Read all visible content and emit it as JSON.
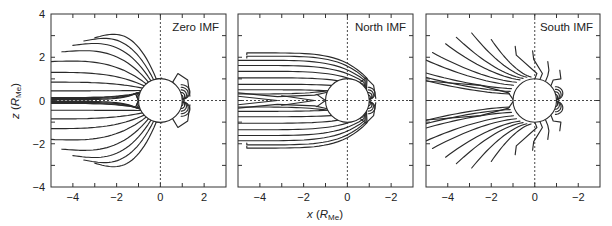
{
  "figure": {
    "y_axis_label_main": "z",
    "y_axis_label_unit": "R",
    "y_axis_label_sub": "Me",
    "x_axis_label_main": "x",
    "x_axis_label_unit": "R",
    "x_axis_label_sub": "Me",
    "colors": {
      "line": "#2a2a2a",
      "frame": "#333333",
      "background": "#ffffff"
    }
  },
  "chart_data": [
    {
      "type": "line",
      "title": "Zero IMF",
      "xlabel": "x (R_Me)",
      "ylabel": "z (R_Me)",
      "xlim": [
        -5,
        3
      ],
      "ylim": [
        -4,
        4
      ],
      "xticks": [
        -4,
        -2,
        0,
        2
      ],
      "xtick_labels": [
        "-4",
        "-2",
        "0",
        "2"
      ],
      "yticks": [
        -4,
        -2,
        0,
        2,
        4
      ],
      "ytick_labels": [
        "-4",
        "-2",
        "0",
        "2",
        "4"
      ],
      "grid": false,
      "reference_lines": {
        "x": 0,
        "z": 0,
        "style": "dotted"
      },
      "planet": {
        "center": [
          0,
          0
        ],
        "radius": 1
      },
      "description": "Closed magnetospheric field lines; tail lines stretched nearly parallel to x-axis, dayside lines compressed near x≈1.2-1.4",
      "tail_line_endpoints_z": [
        0.15,
        0.55,
        0.95,
        1.35,
        1.8,
        2.1,
        2.4,
        2.65,
        2.85,
        -0.15,
        -0.55,
        -0.95,
        -1.35,
        -1.8,
        -2.1,
        -2.4,
        -2.65,
        -2.85
      ],
      "tail_line_endpoints_x": [
        -5,
        -5,
        -5,
        -5,
        -5,
        -4.5,
        -4,
        -3.5,
        -3.1,
        -5,
        -5,
        -5,
        -5,
        -5,
        -4.5,
        -4,
        -3.5,
        -3.1
      ]
    },
    {
      "type": "line",
      "title": "North IMF",
      "xlabel": "x (R_Me)",
      "ylabel": "z (R_Me)",
      "xlim": [
        -5,
        3
      ],
      "ylim": [
        -4,
        4
      ],
      "xticks": [
        -4,
        -2,
        0,
        2
      ],
      "xtick_labels": [
        "-4",
        "-2",
        "0",
        "-2"
      ],
      "yticks": [
        -4,
        -2,
        0,
        2,
        4
      ],
      "ytick_labels": [
        "",
        "",
        "",
        "",
        ""
      ],
      "grid": false,
      "reference_lines": {
        "x": 0,
        "z": 0,
        "style": "dotted"
      },
      "planet": {
        "center": [
          0,
          0
        ],
        "radius": 1
      },
      "description": "Closed field lines forming a blunt, box-like magnetosphere; tail lines turn back near x≈-4.5; inner tail lines close at x≈-3.2 and x≈-1.5",
      "tail_line_endpoints_z": [
        0.7,
        1.0,
        1.3,
        1.6,
        1.9,
        2.1,
        2.2,
        -0.7,
        -1.0,
        -1.3,
        -1.6,
        -1.9,
        -2.1,
        -2.2
      ],
      "tail_line_endpoints_x": [
        -5,
        -5,
        -5,
        -5,
        -5,
        -4.8,
        -4.5,
        -5,
        -5,
        -5,
        -5,
        -5,
        -4.8,
        -4.5
      ]
    },
    {
      "type": "line",
      "title": "South IMF",
      "xlabel": "x (R_Me)",
      "ylabel": "z (R_Me)",
      "xlim": [
        -5,
        3
      ],
      "ylim": [
        -4,
        4
      ],
      "xticks": [
        -4,
        -2,
        0,
        2
      ],
      "xtick_labels": [
        "-4",
        "-2",
        "0",
        "-2"
      ],
      "yticks": [
        -4,
        -2,
        0,
        2,
        4
      ],
      "ytick_labels": [
        "",
        "",
        "",
        "",
        ""
      ],
      "grid": false,
      "reference_lines": {
        "x": 0,
        "z": 0,
        "style": "dotted"
      },
      "planet": {
        "center": [
          0,
          0
        ],
        "radius": 1
      },
      "description": "Open field lines fanning out from the planet toward the tail; small closed loops on the dayside near x≈1.2",
      "tail_line_endpoints_z": [
        0.9,
        1.1,
        1.3,
        1.8,
        2.2,
        2.6,
        2.9,
        3.1,
        2.8,
        2.6,
        -0.9,
        -1.1,
        -1.3,
        -1.8,
        -2.2,
        -2.6,
        -2.9,
        -3.1,
        -2.8,
        -2.6
      ],
      "tail_line_endpoints_x": [
        -5,
        -5,
        -5,
        -5,
        -4.7,
        -4.1,
        -3.6,
        -2.9,
        -2.0,
        -0.9,
        -5,
        -5,
        -5,
        -5,
        -4.7,
        -4.1,
        -3.6,
        -2.9,
        -2.0,
        -0.9
      ]
    }
  ],
  "panels": [
    {
      "label": "Zero IMF",
      "x0": 51,
      "y0": 14,
      "w": 175,
      "h": 173,
      "show_y_labels": true
    },
    {
      "label": "North IMF",
      "x0": 238,
      "y0": 14,
      "w": 175,
      "h": 173,
      "show_y_labels": false
    },
    {
      "label": "South IMF",
      "x0": 426,
      "y0": 14,
      "w": 174,
      "h": 173,
      "show_y_labels": false
    }
  ]
}
